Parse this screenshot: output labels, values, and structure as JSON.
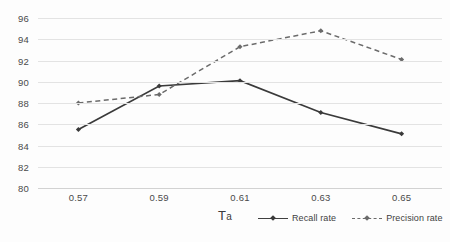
{
  "chart_data": {
    "type": "line",
    "title": "",
    "xlabel": "Ta",
    "ylabel": "",
    "x": [
      0.57,
      0.59,
      0.61,
      0.63,
      0.65
    ],
    "categories": [
      "0.57",
      "0.59",
      "0.61",
      "0.63",
      "0.65"
    ],
    "xlim": [
      0.56,
      0.66
    ],
    "ylim": [
      80,
      96
    ],
    "y_ticks": [
      80,
      82,
      84,
      86,
      88,
      90,
      92,
      94,
      96
    ],
    "y_tick_labels": [
      "80",
      "82",
      "84",
      "86",
      "88",
      "90",
      "92",
      "94",
      "96"
    ],
    "grid": true,
    "grid_axis": "y",
    "legend_position": "bottom-right",
    "series": [
      {
        "name": "Recall rate",
        "values": [
          85.5,
          89.6,
          90.1,
          87.1,
          85.1
        ],
        "line_style": "solid",
        "color": "#3a3a3a",
        "marker": "diamond"
      },
      {
        "name": "Precision rate",
        "values": [
          88.0,
          88.8,
          93.3,
          94.8,
          92.1
        ],
        "line_style": "dashed",
        "color": "#6b6b6b",
        "marker": "diamond"
      }
    ]
  },
  "axis": {
    "x_title_main": "T",
    "x_title_sub": "a"
  },
  "legend": {
    "items": [
      {
        "label": "Recall rate"
      },
      {
        "label": "Precision rate"
      }
    ]
  },
  "colors": {
    "recall": "#3a3a3a",
    "precision": "#6b6b6b",
    "gridline": "#e3e3e3",
    "baseline": "#d2d2d2",
    "background": "#fdfdfd",
    "text": "#4a4a4a"
  }
}
